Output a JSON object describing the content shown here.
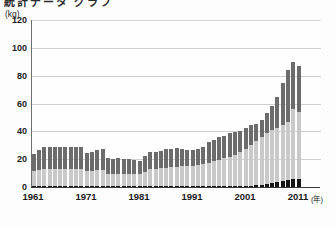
{
  "header": {
    "clipped_title": "統計データ  グラフ",
    "unit_label": "(kg)"
  },
  "chart_data": {
    "type": "bar",
    "stacked": true,
    "title": "",
    "xlabel": "年",
    "ylabel": "(kg)",
    "ylim": [
      0,
      120
    ],
    "yticks": [
      0,
      20,
      40,
      60,
      80,
      100,
      120
    ],
    "xtick_labels": [
      "1961",
      "1971",
      "1981",
      "1991",
      "2001",
      "2011"
    ],
    "xtick_years": [
      1961,
      1971,
      1981,
      1991,
      2001,
      2011
    ],
    "x_unit": "(年)",
    "grid": true,
    "grid_axis": "y",
    "legend": "none",
    "x": [
      1961,
      1962,
      1963,
      1964,
      1965,
      1966,
      1967,
      1968,
      1969,
      1970,
      1971,
      1972,
      1973,
      1974,
      1975,
      1976,
      1977,
      1978,
      1979,
      1980,
      1981,
      1982,
      1983,
      1984,
      1985,
      1986,
      1987,
      1988,
      1989,
      1990,
      1991,
      1992,
      1993,
      1994,
      1995,
      1996,
      1997,
      1998,
      1999,
      2000,
      2001,
      2002,
      2003,
      2004,
      2005,
      2006,
      2007,
      2008,
      2009,
      2010,
      2011
    ],
    "series": [
      {
        "name": "bottom-segment",
        "color": "#151515",
        "values": [
          0.6,
          0.6,
          0.6,
          0.6,
          0.6,
          0.6,
          0.6,
          0.6,
          0.6,
          0.6,
          0.6,
          0.6,
          0.6,
          0.6,
          0.6,
          0.6,
          0.6,
          0.6,
          0.6,
          0.6,
          0.6,
          0.6,
          0.6,
          0.6,
          0.6,
          0.6,
          0.6,
          0.6,
          0.6,
          0.6,
          0.6,
          0.6,
          0.6,
          0.6,
          0.6,
          0.6,
          0.6,
          0.7,
          0.7,
          0.8,
          0.9,
          1.0,
          1.2,
          1.5,
          2.0,
          3.0,
          3.6,
          4.2,
          5.0,
          6.0,
          5.5
        ]
      },
      {
        "name": "middle-segment",
        "color": "#c9c9c9",
        "values": [
          11.0,
          11.5,
          12.0,
          12.5,
          12.5,
          12.5,
          12.5,
          12.5,
          12.5,
          12.5,
          11.0,
          11.0,
          11.5,
          11.5,
          9.0,
          8.5,
          8.5,
          8.5,
          8.5,
          8.5,
          8.5,
          10.5,
          12.0,
          12.5,
          13.0,
          13.0,
          13.5,
          14.0,
          14.5,
          14.5,
          14.5,
          15.0,
          16.0,
          17.0,
          18.0,
          19.0,
          20.0,
          21.0,
          22.5,
          24.5,
          26.5,
          29.0,
          32.0,
          34.5,
          36.5,
          38.0,
          39.0,
          40.5,
          42.0,
          50.0,
          48.5
        ]
      },
      {
        "name": "top-segment",
        "color": "#6c6c6c",
        "values": [
          12.4,
          14.4,
          15.9,
          15.4,
          15.4,
          15.4,
          15.4,
          15.4,
          15.4,
          15.4,
          12.9,
          13.9,
          14.4,
          15.4,
          10.9,
          10.9,
          11.4,
          10.9,
          10.9,
          10.4,
          9.4,
          11.4,
          12.9,
          12.4,
          12.4,
          13.9,
          13.4,
          13.4,
          12.4,
          11.4,
          11.4,
          11.5,
          12.4,
          14.5,
          14.9,
          16.4,
          16.4,
          16.8,
          16.3,
          15.2,
          15.1,
          14.5,
          12.3,
          12.5,
          15.0,
          17.5,
          21.9,
          29.8,
          37.0,
          34.0,
          33.0
        ]
      }
    ],
    "totals": [
      24,
      26.5,
      28.5,
      28.5,
      28.5,
      28.5,
      28.5,
      28.5,
      28.5,
      28.5,
      24.5,
      25.5,
      26.5,
      27.5,
      20.5,
      20,
      20.5,
      20,
      20,
      19.5,
      18.5,
      22.5,
      25.5,
      25.5,
      26,
      27.5,
      27.5,
      28,
      27.5,
      26.5,
      26.5,
      27.1,
      29,
      32.1,
      33.5,
      36,
      37,
      38.5,
      39.5,
      40.5,
      42.5,
      44.5,
      45.5,
      48.5,
      53.5,
      58.5,
      64.5,
      74.5,
      84,
      90,
      87
    ]
  }
}
